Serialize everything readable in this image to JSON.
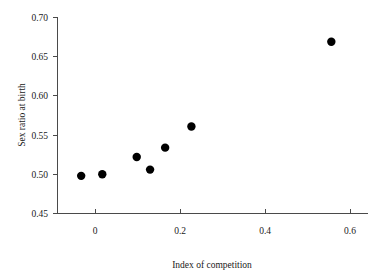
{
  "chart_data": {
    "type": "scatter",
    "title": "",
    "xlabel": "Index of competition",
    "ylabel": "Sex ratio at birth",
    "xlim": [
      -0.055,
      0.665
    ],
    "ylim": [
      0.45,
      0.7
    ],
    "grid": false,
    "legend": null,
    "xticks": [
      0,
      0.2,
      0.4,
      0.6
    ],
    "xticklabels": [
      "0",
      "0.2",
      "0.4",
      "0.6"
    ],
    "yticks": [
      0.45,
      0.5,
      0.55,
      0.6,
      0.65,
      0.7
    ],
    "yticklabels": [
      "0.45",
      "0.50",
      "0.55",
      "0.60",
      "0.65",
      "0.70"
    ],
    "marker": "filled-circle",
    "marker_color": "#000000",
    "marker_size": 4.2,
    "x": [
      0.0,
      0.049,
      0.129,
      0.16,
      0.195,
      0.256,
      0.581
    ],
    "y": [
      0.498,
      0.5,
      0.522,
      0.506,
      0.534,
      0.561,
      0.669
    ],
    "points": [
      {
        "x": 0.0,
        "y": 0.498
      },
      {
        "x": 0.049,
        "y": 0.5
      },
      {
        "x": 0.129,
        "y": 0.522
      },
      {
        "x": 0.16,
        "y": 0.506
      },
      {
        "x": 0.195,
        "y": 0.534
      },
      {
        "x": 0.256,
        "y": 0.561
      },
      {
        "x": 0.581,
        "y": 0.669
      }
    ]
  },
  "axes": {
    "x_title": "Index of competition",
    "y_title": "Sex ratio at birth",
    "x_tick_labels": [
      "0",
      "0.2",
      "0.4",
      "0.6"
    ],
    "y_tick_labels": [
      "0.45",
      "0.50",
      "0.55",
      "0.60",
      "0.65",
      "0.70"
    ],
    "axis_color": "#4a4a4a",
    "text_color": "#1a1a1a"
  }
}
